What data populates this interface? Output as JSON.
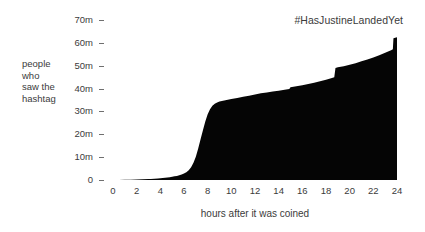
{
  "chart_data": {
    "type": "area",
    "title": "#HasJustineLandedYet",
    "xlabel": "hours after it was coined",
    "ylabel": "people\nwho\nsaw the\nhashtag",
    "xlim": [
      0,
      24
    ],
    "ylim": [
      0,
      70
    ],
    "grid": false,
    "legend": "none",
    "fill_color": "#050505",
    "text_color": "#3b3b3b",
    "y_unit": "m",
    "y_tick_labels": [
      "70m",
      "60m",
      "50m",
      "40m",
      "30m",
      "20m",
      "10m",
      "0"
    ],
    "y_tick_values": [
      70,
      60,
      50,
      40,
      30,
      20,
      10,
      0
    ],
    "x_tick_labels": [
      "0",
      "2",
      "4",
      "6",
      "8",
      "10",
      "12",
      "14",
      "16",
      "18",
      "20",
      "22",
      "24"
    ],
    "x_tick_values": [
      0,
      2,
      4,
      6,
      8,
      10,
      12,
      14,
      16,
      18,
      20,
      22,
      24
    ],
    "x": [
      0,
      0.5,
      1,
      1.5,
      2,
      2.5,
      3,
      3.2,
      3.5,
      3.8,
      4,
      4.2,
      4.4,
      4.6,
      4.8,
      5,
      5.2,
      5.4,
      5.6,
      5.8,
      6,
      6.2,
      6.4,
      6.6,
      6.8,
      7,
      7.2,
      7.4,
      7.6,
      7.8,
      8,
      8.2,
      8.4,
      8.6,
      8.8,
      9,
      9.5,
      10,
      10.5,
      11,
      11.5,
      12,
      12.5,
      13,
      13.5,
      14,
      14.5,
      14.9,
      15,
      15.5,
      16,
      16.5,
      17,
      17.5,
      18,
      18.5,
      18.7,
      18.8,
      19,
      19.5,
      20,
      20.5,
      21,
      21.5,
      22,
      22.5,
      23,
      23.5,
      23.65,
      23.7,
      24
    ],
    "y": [
      0,
      0.05,
      0.1,
      0.15,
      0.2,
      0.3,
      0.4,
      0.45,
      0.55,
      0.65,
      0.75,
      0.85,
      0.95,
      1.1,
      1.25,
      1.4,
      1.6,
      1.8,
      2.1,
      2.4,
      2.8,
      3.4,
      4.3,
      5.6,
      7.5,
      10.2,
      13.8,
      17.8,
      21.8,
      25.6,
      28.8,
      31.0,
      32.5,
      33.4,
      33.9,
      34.3,
      34.9,
      35.4,
      35.9,
      36.4,
      36.9,
      37.4,
      37.9,
      38.3,
      38.7,
      39.1,
      39.5,
      39.8,
      40.6,
      41.0,
      41.5,
      42.0,
      42.6,
      43.2,
      43.9,
      44.6,
      45.0,
      49.0,
      49.3,
      49.8,
      50.4,
      51.1,
      51.9,
      52.7,
      53.6,
      54.6,
      55.7,
      56.8,
      57.2,
      62.0,
      62.4
    ],
    "series": [
      {
        "name": "people who saw the hashtag",
        "description": "cumulative views of the hashtag over 24 hours, peaking just above 60m"
      }
    ],
    "annotations": [
      {
        "label": "takeoff begins",
        "x": 6,
        "y": 2.8
      },
      {
        "label": "knee of the curve",
        "x": 8.6,
        "y": 33.4
      },
      {
        "label": "step up",
        "x": 18.7,
        "y": 49.0
      },
      {
        "label": "final spike",
        "x": 23.7,
        "y": 62.0
      }
    ]
  }
}
